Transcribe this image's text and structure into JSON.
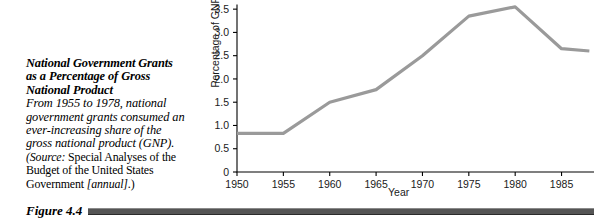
{
  "caption": {
    "title": "National Government Grants as a Percentage of Gross National Product",
    "body": "From 1955 to 1978, national government grants consumed an ever-increasing share of the gross national product (GNP).",
    "source_lead": "(Source:",
    "source_text": " Special Analyses of the Budget of the United States Government ",
    "source_tail": "[annual]",
    "source_end": ".)",
    "figure_number": "Figure 4.4"
  },
  "chart_data": {
    "type": "line",
    "title": "",
    "xlabel": "Year",
    "ylabel": "Percentage of GNP",
    "x": [
      1950,
      1955,
      1960,
      1965,
      1970,
      1975,
      1980,
      1985,
      1988
    ],
    "values": [
      0.83,
      0.83,
      1.5,
      1.77,
      2.5,
      3.35,
      3.55,
      2.65,
      2.6
    ],
    "xticks": [
      1950,
      1955,
      1960,
      1965,
      1970,
      1975,
      1980,
      1985
    ],
    "xticklabels": [
      "1950",
      "1955",
      "1960",
      "1965",
      "1970",
      "1975",
      "1980",
      "1985"
    ],
    "yticks": [
      0,
      0.5,
      1.0,
      1.5,
      2.0,
      2.5,
      3.0,
      3.5
    ],
    "yticklabels": [
      "0",
      "0.5",
      "1.0",
      "1.5",
      "2.0",
      "2.5",
      "3.0",
      "3.5"
    ],
    "xlim": [
      1950,
      1988.5
    ],
    "ylim": [
      0,
      3.6
    ],
    "grid": false,
    "legend": false,
    "line_color": "#9a9a9a",
    "line_width": 3.2,
    "axis_color": "#000000",
    "note": "Chart is cropped at the right edge of the figure; series continues past 1985."
  }
}
